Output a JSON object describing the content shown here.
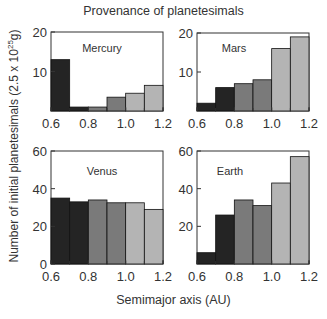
{
  "title": "Provenance of planetesimals",
  "ylabel": "Number of initial planetesimals (2.5 x 10^25 g)",
  "ylabel_parts": {
    "pre": "Number of initial planetesimals (2.5 x 10",
    "exp": "25",
    "post": "g)"
  },
  "xlabel": "Semimajor axis (AU)",
  "colors": {
    "dark": "#242424",
    "medium": "#7a7a7a",
    "light": "#b4b4b4",
    "edge": "#111111"
  },
  "chart_data": [
    {
      "type": "bar",
      "title": "Mercury",
      "categories": [
        "0.6-0.7",
        "0.7-0.8",
        "0.8-0.9",
        "0.9-1.0",
        "1.0-1.1",
        "1.1-1.2"
      ],
      "values": [
        13,
        1,
        1,
        3.5,
        4.5,
        6.5
      ],
      "xlabel": "Semimajor axis (AU)",
      "ylabel": "Number of initial planetesimals",
      "xlim": [
        0.6,
        1.2
      ],
      "ylim": [
        0,
        20
      ],
      "xticks": [
        "0.6",
        "0.8",
        "1.0",
        "1.2"
      ],
      "yticks": [
        "10",
        "20"
      ]
    },
    {
      "type": "bar",
      "title": "Mars",
      "categories": [
        "0.6-0.7",
        "0.7-0.8",
        "0.8-0.9",
        "0.9-1.0",
        "1.0-1.1",
        "1.1-1.2"
      ],
      "values": [
        2,
        6,
        7,
        8,
        16,
        19
      ],
      "xlabel": "Semimajor axis (AU)",
      "ylabel": "Number of initial planetesimals",
      "xlim": [
        0.6,
        1.2
      ],
      "ylim": [
        0,
        20
      ],
      "xticks": [
        "0.6",
        "0.8",
        "1.0",
        "1.2"
      ],
      "yticks": [
        "10",
        "20"
      ]
    },
    {
      "type": "bar",
      "title": "Venus",
      "categories": [
        "0.6-0.7",
        "0.7-0.8",
        "0.8-0.9",
        "0.9-1.0",
        "1.0-1.1",
        "1.1-1.2"
      ],
      "values": [
        35,
        33,
        34,
        32.5,
        32.5,
        29
      ],
      "xlabel": "Semimajor axis (AU)",
      "ylabel": "Number of initial planetesimals",
      "xlim": [
        0.6,
        1.2
      ],
      "ylim": [
        0,
        60
      ],
      "xticks": [
        "0.6",
        "0.8",
        "1.0",
        "1.2"
      ],
      "yticks": [
        "0",
        "20",
        "40",
        "60"
      ]
    },
    {
      "type": "bar",
      "title": "Earth",
      "categories": [
        "0.6-0.7",
        "0.7-0.8",
        "0.8-0.9",
        "0.9-1.0",
        "1.0-1.1",
        "1.1-1.2"
      ],
      "values": [
        6,
        26,
        34,
        31,
        43,
        57
      ],
      "xlabel": "Semimajor axis (AU)",
      "ylabel": "Number of initial planetesimals",
      "xlim": [
        0.6,
        1.2
      ],
      "ylim": [
        0,
        60
      ],
      "xticks": [
        "0.6",
        "0.8",
        "1.0",
        "1.2"
      ],
      "yticks": [
        "20",
        "40",
        "60"
      ]
    }
  ]
}
